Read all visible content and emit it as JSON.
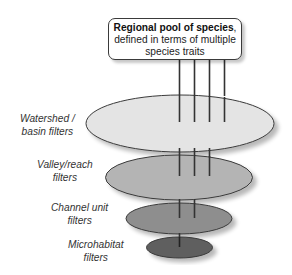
{
  "pool_box": {
    "title_bold": "Regional pool of species",
    "title_suffix": ",",
    "line2": "defined in terms of multiple",
    "line3": "species traits"
  },
  "layers": [
    {
      "name": "watershed",
      "label_line1": "Watershed /",
      "label_line2": "basin filters",
      "fill": "#e4e4e4",
      "trait_lines": 4
    },
    {
      "name": "valley",
      "label_line1": "Valley/reach",
      "label_line2": "filters",
      "fill": "#b4b4b4",
      "trait_lines": 3
    },
    {
      "name": "channel",
      "label_line1": "Channel unit",
      "label_line2": "filters",
      "fill": "#8e8e8e",
      "trait_lines": 2
    },
    {
      "name": "microhabitat",
      "label_line1": "Microhabitat",
      "label_line2": "filters",
      "fill": "#5e5e5e",
      "trait_lines": 1
    }
  ],
  "colors": {
    "line": "#333333",
    "outline": "#3a3a3a"
  }
}
